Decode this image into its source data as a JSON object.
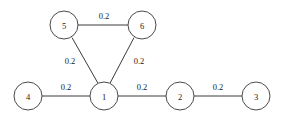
{
  "figure": {
    "type": "undirected-weighted-graph",
    "width": 284,
    "height": 121,
    "background_color": "#ffffff",
    "stroke_color": "#3a3a3a",
    "node_fill_color": "#ffffff",
    "node_stroke_color": "#4a4a4a",
    "text_color": "#1a1a1a",
    "node_radius": 14
  },
  "nodes": [
    {
      "id": "5",
      "label": "5",
      "x": 64,
      "y": 25
    },
    {
      "id": "6",
      "label": "6",
      "x": 142,
      "y": 25
    },
    {
      "id": "4",
      "label": "4",
      "x": 28,
      "y": 96
    },
    {
      "id": "1",
      "label": "1",
      "x": 104,
      "y": 96
    },
    {
      "id": "2",
      "label": "2",
      "x": 180,
      "y": 96
    },
    {
      "id": "3",
      "label": "3",
      "x": 256,
      "y": 96
    }
  ],
  "edges": [
    {
      "from": "5",
      "to": "6",
      "weight": "0.2",
      "label_x": 104,
      "label_y": 16
    },
    {
      "from": "5",
      "to": "1",
      "weight": "0.2",
      "label_x": 70,
      "label_y": 61
    },
    {
      "from": "6",
      "to": "1",
      "weight": "0.2",
      "label_x": 139,
      "label_y": 61
    },
    {
      "from": "4",
      "to": "1",
      "weight": "0.2",
      "label_x": 66,
      "label_y": 87
    },
    {
      "from": "1",
      "to": "2",
      "weight": "0.2",
      "label_x": 142,
      "label_y": 87
    },
    {
      "from": "2",
      "to": "3",
      "weight": "0.2",
      "label_x": 218,
      "label_y": 87
    }
  ]
}
